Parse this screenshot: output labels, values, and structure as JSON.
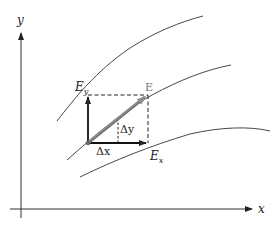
{
  "diagram": {
    "type": "vector-field-decomposition",
    "axes": {
      "x_label": "x",
      "y_label": "y"
    },
    "field_lines": [
      {
        "name": "field-line-top"
      },
      {
        "name": "field-line-middle"
      },
      {
        "name": "field-line-bottom"
      }
    ],
    "vectors": {
      "E": {
        "label": "E",
        "color": "#8c8c8c"
      },
      "E_x": {
        "label_main": "E",
        "label_sub": "x"
      },
      "E_y": {
        "label_main": "E",
        "label_sub": "y"
      }
    },
    "displacements": {
      "dx": {
        "label": "Δx"
      },
      "dy": {
        "label": "Δy"
      }
    },
    "colors": {
      "line": "#222222",
      "vector_E": "#8c8c8c",
      "background": "#ffffff"
    }
  }
}
